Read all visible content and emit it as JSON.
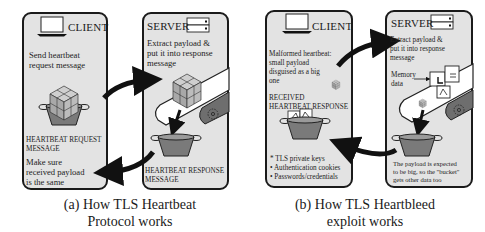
{
  "figure_a": {
    "caption_line1": "(a) How TLS Heartbeat",
    "caption_line2": "Protocol works",
    "client": {
      "title": "CLIENT",
      "icon": "laptop-icon",
      "step_line1": "Send heartbeat",
      "step_line2": "request message",
      "bucket_label_line1": "HEARTBEAT REQUEST",
      "bucket_label_line2": "MESSAGE",
      "check_line1": "Make sure",
      "check_line2": "received payload",
      "check_line3": "is the same"
    },
    "server": {
      "title": "SERVER",
      "icon": "server-rack-icon",
      "step_line1": "Extract payload &",
      "step_line2": "put it into response",
      "step_line3": "message",
      "bucket_label_line1": "HEARTBEAT RESPONSE",
      "bucket_label_line2": "MESSAGE"
    }
  },
  "figure_b": {
    "caption_line1": "(b) How TLS Heartbleed",
    "caption_line2": "exploit works",
    "client": {
      "title": "CLIENT",
      "icon": "laptop-icon",
      "step_line1": "Malformed heartbeat:",
      "step_line2": "small payload",
      "step_line3": "disguised as a big",
      "step_line4": "one",
      "received_line1": "RECEIVED",
      "received_line2": "HEARTBEAT RESPONSE",
      "leaked_items": [
        "* TLS private keys",
        "• Authentication cookies",
        "• Passwords/credentials"
      ]
    },
    "server": {
      "title": "SERVER",
      "icon": "server-rack-icon",
      "step_line1": "Extract payload &",
      "step_line2": "put it into response",
      "step_line3": "message",
      "memory_label_line1": "Memory",
      "memory_label_line2": "data",
      "note_line1": "The payload is expected",
      "note_line2": "to be big, so the \"bucket\"",
      "note_line3": "gets other data too"
    }
  },
  "colors": {
    "panel_fill": "#e3e3e3",
    "outline": "#1a1a1a",
    "bucket_fill": "#7a7a7a",
    "cube_fill": "#b8b8b8",
    "belt_fill": "#ffffff",
    "roller_fill": "#6e6e6e"
  }
}
